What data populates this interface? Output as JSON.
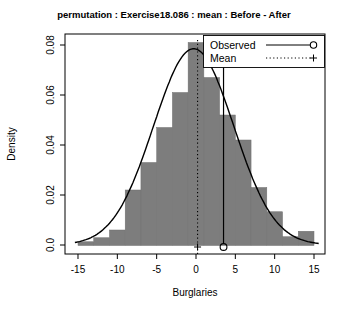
{
  "figure": {
    "background": "#ffffff"
  },
  "chart_data": {
    "type": "bar",
    "subtype": "density-histogram-with-normal-curve",
    "title": "permutation : Exercise18.086 : mean : Before - After",
    "xlabel": "Burglaries",
    "ylabel": "Density",
    "xlim": [
      -16.5,
      16.5
    ],
    "ylim": [
      0,
      0.08
    ],
    "grid": false,
    "x_ticks": {
      "values": [
        -15,
        -10,
        -5,
        0,
        5,
        10,
        15
      ],
      "labels": [
        "-15",
        "-10",
        "-5",
        "0",
        "5",
        "10",
        "15"
      ]
    },
    "y_ticks": {
      "values": [
        0,
        0.02,
        0.04,
        0.06,
        0.08
      ],
      "labels": [
        "0.0",
        "0.02",
        "0.04",
        "0.06",
        "0.08"
      ]
    },
    "bin_width": 2,
    "categories": [
      -14,
      -12,
      -10,
      -8,
      -6,
      -4,
      -2,
      0,
      2,
      4,
      6,
      8,
      10,
      12,
      14
    ],
    "values": [
      0.0013,
      0.0029,
      0.006,
      0.022,
      0.033,
      0.047,
      0.061,
      0.081,
      0.067,
      0.052,
      0.042,
      0.023,
      0.0133,
      0.0033,
      0.0055
    ],
    "curve": {
      "type": "normal",
      "mean": -0.3,
      "sd": 5.1,
      "peak_density": 0.0785
    },
    "markers": {
      "mean": {
        "x": 0.2,
        "line_style": "dotted",
        "marker": "plus",
        "line_top_density": 0.082
      },
      "observed": {
        "x": 3.5,
        "line_style": "solid",
        "marker": "circle",
        "line_top_density": 0.073
      }
    },
    "legend": {
      "position": "top-right",
      "items": [
        {
          "label": "Observed",
          "line": "solid",
          "marker": "circle"
        },
        {
          "label": "Mean",
          "line": "dotted",
          "marker": "plus"
        }
      ]
    },
    "colors": {
      "bar_fill": "#7d7d7d",
      "bar_border": "#707070",
      "line": "#000000",
      "background": "#ffffff"
    }
  }
}
